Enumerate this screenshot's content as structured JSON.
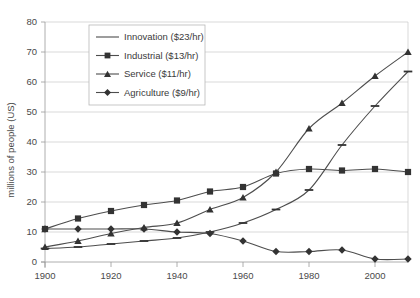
{
  "chart_data": {
    "type": "line",
    "title": "",
    "subtitle": "",
    "xlabel": "",
    "ylabel": "millions of people (US)",
    "xlim": [
      1900,
      2010
    ],
    "ylim": [
      0,
      80
    ],
    "grid": true,
    "legend_position": "top-left-inside",
    "x": [
      1900,
      1910,
      1920,
      1930,
      1940,
      1950,
      1960,
      1970,
      1980,
      1990,
      2000,
      2010
    ],
    "xticks": [
      1900,
      1920,
      1940,
      1960,
      1980,
      2000
    ],
    "xticklabels": [
      "1900",
      "1920",
      "1940",
      "1960",
      "1980",
      "2000"
    ],
    "yticks": [
      0,
      10,
      20,
      30,
      40,
      50,
      60,
      70,
      80
    ],
    "yticklabels": [
      "0",
      "10",
      "20",
      "30",
      "40",
      "50",
      "60",
      "70",
      "80"
    ],
    "series": [
      {
        "name": "Innovation ($23/hr)",
        "marker": "line",
        "color": "#4d4d4d",
        "values": [
          4.5,
          5.0,
          6.0,
          7.0,
          8.0,
          10.0,
          13.0,
          17.5,
          24.0,
          39.0,
          52.0,
          63.5
        ]
      },
      {
        "name": "Industrial ($13/hr)",
        "marker": "square",
        "color": "#4d4d4d",
        "values": [
          11.0,
          14.5,
          17.0,
          19.0,
          20.5,
          23.5,
          25.0,
          29.5,
          31.0,
          30.5,
          31.0,
          30.0
        ]
      },
      {
        "name": "Service ($11/hr)",
        "marker": "triangle",
        "color": "#4d4d4d",
        "values": [
          5.0,
          7.0,
          9.5,
          11.5,
          13.0,
          17.5,
          21.5,
          30.0,
          44.5,
          53.0,
          62.0,
          70.0
        ]
      },
      {
        "name": "Agriculture ($9/hr)",
        "marker": "diamond",
        "color": "#4d4d4d",
        "values": [
          11.0,
          11.0,
          11.0,
          11.0,
          10.0,
          9.5,
          7.0,
          3.5,
          3.5,
          4.0,
          1.0,
          1.0
        ]
      }
    ]
  },
  "legend": {
    "entries": [
      {
        "label": "Innovation ($23/hr)",
        "marker": "line"
      },
      {
        "label": "Industrial ($13/hr)",
        "marker": "square"
      },
      {
        "label": "Service ($11/hr)",
        "marker": "triangle"
      },
      {
        "label": "Agriculture ($9/hr)",
        "marker": "diamond"
      }
    ]
  }
}
